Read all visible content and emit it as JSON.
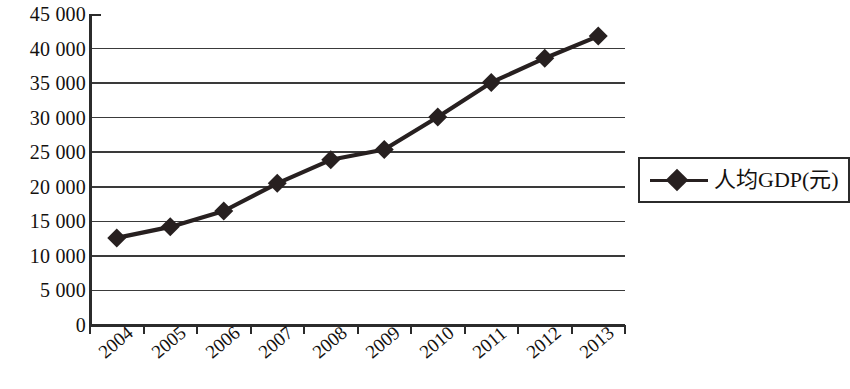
{
  "chart_data": {
    "type": "line",
    "title": "",
    "subtitle": "",
    "xlabel": "",
    "ylabel": "",
    "categories": [
      "2004",
      "2005",
      "2006",
      "2007",
      "2008",
      "2009",
      "2010",
      "2011",
      "2012",
      "2013"
    ],
    "series": [
      {
        "name": "人均GDP(元)",
        "values": [
          12600,
          14200,
          16500,
          20500,
          23900,
          25400,
          30100,
          35100,
          38600,
          41800
        ],
        "color": "#272020",
        "marker": "diamond"
      }
    ],
    "ylim": [
      0,
      45000
    ],
    "ytick_values": [
      0,
      5000,
      10000,
      15000,
      20000,
      25000,
      30000,
      35000,
      40000,
      45000
    ],
    "ytick_labels": [
      "0",
      "5 000",
      "10 000",
      "15 000",
      "20 000",
      "25 000",
      "30 000",
      "35 000",
      "40 000",
      "45 000"
    ],
    "xtick_labels": [
      "2004",
      "2005",
      "2006",
      "2007",
      "2008",
      "2009",
      "2010",
      "2011",
      "2012",
      "2013"
    ],
    "grid": {
      "horizontal": true,
      "vertical": false,
      "color": "#3a3a3a"
    },
    "legend": {
      "position": "right",
      "entries": [
        {
          "label": "人均GDP(元)",
          "marker": "diamond",
          "color": "#272020"
        }
      ]
    },
    "axis": {
      "line_color": "#2b2b2b",
      "tick_marks": "outward"
    },
    "plot_area": {
      "left": 90,
      "right": 625,
      "top": 14,
      "bottom": 325
    }
  },
  "legend_box": {
    "label": "人均GDP(元)"
  }
}
